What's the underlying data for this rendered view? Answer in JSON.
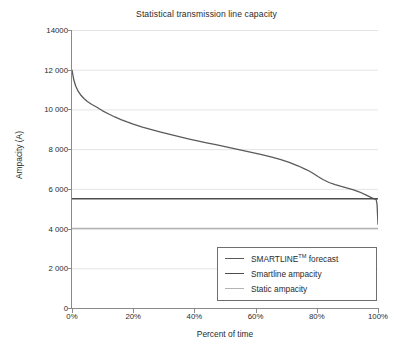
{
  "chart_data": {
    "type": "line",
    "title": "Statistical transmission line capacity",
    "xlabel": "Percent of time",
    "ylabel": "Ampacity (A)",
    "xlim": [
      0,
      100
    ],
    "ylim": [
      0,
      14000
    ],
    "grid": true,
    "grid_axis": "y",
    "legend_position": "lower right",
    "x_ticks": [
      0,
      20,
      40,
      60,
      80,
      100
    ],
    "x_tick_labels": [
      "0%",
      "20%",
      "40%",
      "60%",
      "80%",
      "100%"
    ],
    "y_ticks": [
      0,
      2000,
      4000,
      6000,
      8000,
      10000,
      12000,
      14000
    ],
    "y_tick_labels": [
      "0",
      "2 000",
      "4 000",
      "6 000",
      "8 000",
      "10 000",
      "12 000",
      "14000"
    ],
    "series": [
      {
        "name": "SMARTLINE™ forecast",
        "type": "line",
        "color": "#5a5a5a",
        "x": [
          0,
          0.6,
          1.2,
          2,
          3,
          4,
          5,
          6.5,
          8,
          10,
          12,
          14,
          16,
          18,
          20,
          23,
          26,
          29,
          32,
          35,
          38,
          41,
          44,
          47,
          50,
          53,
          56,
          59,
          62,
          65,
          68,
          71,
          74,
          76,
          77.5,
          79,
          80.5,
          82,
          84,
          86,
          88,
          90,
          92,
          94,
          96,
          97.5,
          98.5,
          99.1,
          99.4,
          99.7,
          100
        ],
        "y": [
          11980,
          11480,
          11180,
          10920,
          10700,
          10540,
          10400,
          10250,
          10120,
          9930,
          9770,
          9620,
          9490,
          9370,
          9260,
          9110,
          8980,
          8860,
          8740,
          8630,
          8520,
          8420,
          8320,
          8230,
          8130,
          8030,
          7930,
          7830,
          7720,
          7610,
          7480,
          7330,
          7150,
          7010,
          6900,
          6760,
          6610,
          6470,
          6320,
          6210,
          6120,
          6040,
          5950,
          5840,
          5700,
          5580,
          5510,
          5480,
          5470,
          5200,
          4220
        ]
      },
      {
        "name": "Smartline ampacity",
        "type": "hline",
        "color": "#4d4d4d",
        "value": 5500
      },
      {
        "name": "Static ampacity",
        "type": "hline",
        "color": "#b3b3b3",
        "value": 4000
      }
    ]
  },
  "legend": {
    "items": [
      {
        "label_prefix": "SMARTLINE",
        "label_sup": "TM",
        "label_suffix": " forecast",
        "color": "#5a5a5a"
      },
      {
        "label_prefix": "Smartline ampacity",
        "label_sup": "",
        "label_suffix": "",
        "color": "#4d4d4d"
      },
      {
        "label_prefix": "Static ampacity",
        "label_sup": "",
        "label_suffix": "",
        "color": "#b3b3b3"
      }
    ]
  },
  "colors": {
    "axis": "#8a8a8a",
    "grid": "#e4e4e4",
    "text": "#2b2b2b",
    "background": "#ffffff"
  }
}
